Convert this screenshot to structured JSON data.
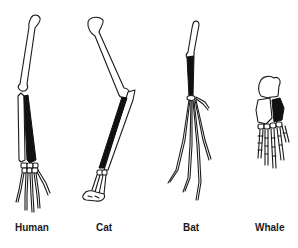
{
  "figure": {
    "type": "homologous-forelimb-skeletons",
    "colors": {
      "ink": "#1a1a1a",
      "radius_highlight": "#111111",
      "background": "#ffffff"
    },
    "limbs": [
      {
        "id": "human",
        "label": "Human"
      },
      {
        "id": "cat",
        "label": "Cat"
      },
      {
        "id": "bat",
        "label": "Bat"
      },
      {
        "id": "whale",
        "label": "Whale"
      }
    ]
  }
}
